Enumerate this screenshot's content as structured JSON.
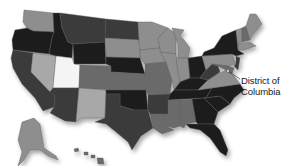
{
  "map": {
    "title": "",
    "callout": {
      "label_line1": "District of",
      "label_line2": "Columbia"
    },
    "shade_palette": {
      "darkest": "#1e1e1e",
      "dark": "#3a3a3a",
      "mid": "#6b6b6b",
      "light": "#8e8e8e",
      "lighter": "#a8a8a8",
      "lightest": "#f4f4f4"
    },
    "states": [
      {
        "id": "WA",
        "shade": "light"
      },
      {
        "id": "OR",
        "shade": "darkest"
      },
      {
        "id": "CA",
        "shade": "dark"
      },
      {
        "id": "NV",
        "shade": "lighter"
      },
      {
        "id": "ID",
        "shade": "darkest"
      },
      {
        "id": "MT",
        "shade": "dark"
      },
      {
        "id": "WY",
        "shade": "darkest"
      },
      {
        "id": "UT",
        "shade": "lightest"
      },
      {
        "id": "AZ",
        "shade": "dark"
      },
      {
        "id": "CO",
        "shade": "mid"
      },
      {
        "id": "NM",
        "shade": "lighter"
      },
      {
        "id": "ND",
        "shade": "dark"
      },
      {
        "id": "SD",
        "shade": "light"
      },
      {
        "id": "NE",
        "shade": "darkest"
      },
      {
        "id": "KS",
        "shade": "mid"
      },
      {
        "id": "OK",
        "shade": "darkest"
      },
      {
        "id": "TX",
        "shade": "dark"
      },
      {
        "id": "MN",
        "shade": "light"
      },
      {
        "id": "IA",
        "shade": "light"
      },
      {
        "id": "MO",
        "shade": "mid"
      },
      {
        "id": "AR",
        "shade": "dark"
      },
      {
        "id": "LA",
        "shade": "mid"
      },
      {
        "id": "WI",
        "shade": "light"
      },
      {
        "id": "IL",
        "shade": "light"
      },
      {
        "id": "MI",
        "shade": "light"
      },
      {
        "id": "IN",
        "shade": "light"
      },
      {
        "id": "OH",
        "shade": "darkest"
      },
      {
        "id": "KY",
        "shade": "darkest"
      },
      {
        "id": "TN",
        "shade": "darkest"
      },
      {
        "id": "MS",
        "shade": "mid"
      },
      {
        "id": "AL",
        "shade": "mid"
      },
      {
        "id": "GA",
        "shade": "darkest"
      },
      {
        "id": "FL",
        "shade": "darkest"
      },
      {
        "id": "SC",
        "shade": "darkest"
      },
      {
        "id": "NC",
        "shade": "darkest"
      },
      {
        "id": "VA",
        "shade": "light"
      },
      {
        "id": "WV",
        "shade": "dark"
      },
      {
        "id": "PA",
        "shade": "light"
      },
      {
        "id": "NY",
        "shade": "darkest"
      },
      {
        "id": "VT",
        "shade": "light"
      },
      {
        "id": "NH",
        "shade": "mid"
      },
      {
        "id": "ME",
        "shade": "light"
      },
      {
        "id": "MA",
        "shade": "light"
      },
      {
        "id": "NJ",
        "shade": "dark"
      },
      {
        "id": "MD",
        "shade": "mid"
      },
      {
        "id": "AK",
        "shade": "light"
      },
      {
        "id": "HI",
        "shade": "mid"
      }
    ]
  }
}
